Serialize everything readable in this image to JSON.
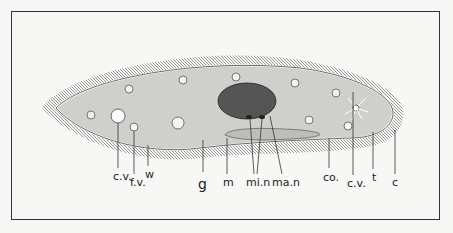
{
  "figure": {
    "labels": [
      {
        "id": "cv1",
        "text": "c.v.",
        "x": 113,
        "y": 171
      },
      {
        "id": "fv",
        "text": "f.v.",
        "x": 130,
        "y": 177
      },
      {
        "id": "w",
        "text": "w",
        "x": 145,
        "y": 169
      },
      {
        "id": "g",
        "text": "g",
        "x": 198,
        "y": 177
      },
      {
        "id": "m",
        "text": "m",
        "x": 223,
        "y": 177
      },
      {
        "id": "min",
        "text": "mi.n",
        "x": 246,
        "y": 177
      },
      {
        "id": "man",
        "text": "ma.n",
        "x": 272,
        "y": 177
      },
      {
        "id": "co",
        "text": "co.",
        "x": 323,
        "y": 172
      },
      {
        "id": "cv2",
        "text": "c.v.",
        "x": 347,
        "y": 178
      },
      {
        "id": "t",
        "text": "t",
        "x": 372,
        "y": 172
      },
      {
        "id": "c",
        "text": "c",
        "x": 392,
        "y": 177
      }
    ]
  }
}
